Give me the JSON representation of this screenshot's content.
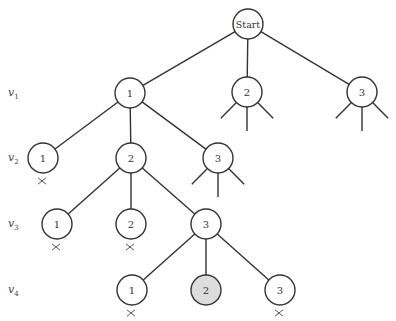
{
  "diagram": {
    "type": "search-tree",
    "level_labels": [
      {
        "var": "v",
        "sub": "1",
        "y": 93
      },
      {
        "var": "v",
        "sub": "2",
        "y": 158
      },
      {
        "var": "v",
        "sub": "3",
        "y": 224
      },
      {
        "var": "v",
        "sub": "4",
        "y": 290
      }
    ],
    "colors": {
      "stroke": "#333333",
      "highlight_fill": "#dddddd",
      "fill": "#ffffff"
    },
    "nodes": [
      {
        "id": "start",
        "label": "Start",
        "x": 248,
        "y": 24,
        "crossed": false,
        "shaded": false
      },
      {
        "id": "v1_1",
        "label": "1",
        "x": 130,
        "y": 93,
        "crossed": false,
        "shaded": false
      },
      {
        "id": "v1_2",
        "label": "2",
        "x": 247,
        "y": 92,
        "crossed": false,
        "shaded": false,
        "stubs": true
      },
      {
        "id": "v1_3",
        "label": "3",
        "x": 362,
        "y": 92,
        "crossed": false,
        "shaded": false,
        "stubs": true
      },
      {
        "id": "v2_1",
        "label": "1",
        "x": 43,
        "y": 158,
        "crossed": true,
        "shaded": false
      },
      {
        "id": "v2_2",
        "label": "2",
        "x": 131,
        "y": 158,
        "crossed": false,
        "shaded": false
      },
      {
        "id": "v2_3",
        "label": "3",
        "x": 218,
        "y": 158,
        "crossed": false,
        "shaded": false,
        "stubs": true
      },
      {
        "id": "v3_1",
        "label": "1",
        "x": 57,
        "y": 224,
        "crossed": true,
        "shaded": false
      },
      {
        "id": "v3_2",
        "label": "2",
        "x": 131,
        "y": 224,
        "crossed": true,
        "shaded": false
      },
      {
        "id": "v3_3",
        "label": "3",
        "x": 206,
        "y": 224,
        "crossed": false,
        "shaded": false
      },
      {
        "id": "v4_1",
        "label": "1",
        "x": 132,
        "y": 290,
        "crossed": true,
        "shaded": false
      },
      {
        "id": "v4_2",
        "label": "2",
        "x": 206,
        "y": 290,
        "crossed": false,
        "shaded": true
      },
      {
        "id": "v4_3",
        "label": "3",
        "x": 280,
        "y": 290,
        "crossed": true,
        "shaded": false
      }
    ],
    "edges": [
      [
        "start",
        "v1_1"
      ],
      [
        "start",
        "v1_2"
      ],
      [
        "start",
        "v1_3"
      ],
      [
        "v1_1",
        "v2_1"
      ],
      [
        "v1_1",
        "v2_2"
      ],
      [
        "v1_1",
        "v2_3"
      ],
      [
        "v2_2",
        "v3_1"
      ],
      [
        "v2_2",
        "v3_2"
      ],
      [
        "v2_2",
        "v3_3"
      ],
      [
        "v3_3",
        "v4_1"
      ],
      [
        "v3_3",
        "v4_2"
      ],
      [
        "v3_3",
        "v4_3"
      ]
    ]
  }
}
